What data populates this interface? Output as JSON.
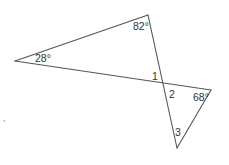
{
  "figure": {
    "type": "two triangles sharing a vertex via intersecting lines (vertical angles)",
    "stroke_color": "#555555",
    "label_color": "#333333",
    "vertices": {
      "left": [
        15,
        61
      ],
      "top": [
        148,
        15
      ],
      "intersection": [
        163,
        82
      ],
      "right": [
        211,
        90
      ],
      "bottom": [
        177,
        148
      ]
    },
    "angle_labels": {
      "top_angle": "82°",
      "left_angle": "28°",
      "angle_1": "1",
      "angle_2": "2",
      "right_angle": "68°",
      "angle_3": "3"
    },
    "stray_mark": ","
  }
}
